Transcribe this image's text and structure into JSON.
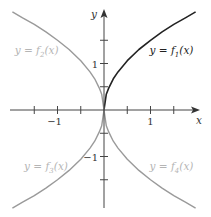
{
  "chart_data": {
    "type": "line",
    "title": "",
    "xlabel": "x",
    "ylabel": "y",
    "xlim": [
      -2,
      2
    ],
    "ylim": [
      -2,
      2
    ],
    "grid": false,
    "x_ticks": [
      -1.5,
      -1,
      -0.5,
      0.5,
      1,
      1.5
    ],
    "x_tick_labels": [
      {
        "value": -1,
        "label": "−1"
      },
      {
        "value": 1,
        "label": "1"
      }
    ],
    "y_ticks": [
      -1.5,
      -1,
      -0.5,
      0.5,
      1,
      1.5
    ],
    "y_tick_labels": [
      {
        "value": 1,
        "label": "1"
      },
      {
        "value": -1,
        "label": "−1"
      }
    ],
    "series": [
      {
        "name": "y = f1(x)",
        "label_main": "y = f",
        "label_sub": "1",
        "label_tail": "(x)",
        "color": "#222222",
        "quadrant": [
          1,
          1
        ],
        "x": [
          0,
          0.05,
          0.1,
          0.2,
          0.3,
          0.5,
          0.75,
          1,
          1.25,
          1.5,
          1.75,
          1.97
        ],
        "y": [
          0,
          0.34,
          0.47,
          0.67,
          0.82,
          1.06,
          1.3,
          1.5,
          1.68,
          1.84,
          1.98,
          2.11
        ]
      },
      {
        "name": "y = f2(x)",
        "label_main": "y = f",
        "label_sub": "2",
        "label_tail": "(x)",
        "color": "#9a9a9a",
        "quadrant": [
          -1,
          1
        ],
        "x": [
          0,
          -0.05,
          -0.1,
          -0.2,
          -0.3,
          -0.5,
          -0.75,
          -1,
          -1.25,
          -1.5,
          -1.75,
          -1.97
        ],
        "y": [
          0,
          0.34,
          0.47,
          0.67,
          0.82,
          1.06,
          1.3,
          1.5,
          1.68,
          1.84,
          1.98,
          2.11
        ]
      },
      {
        "name": "y = f3(x)",
        "label_main": "y = f",
        "label_sub": "3",
        "label_tail": "(x)",
        "color": "#9a9a9a",
        "quadrant": [
          -1,
          -1
        ],
        "x": [
          0,
          -0.05,
          -0.1,
          -0.2,
          -0.3,
          -0.5,
          -0.75,
          -1,
          -1.25,
          -1.5,
          -1.75,
          -1.97
        ],
        "y": [
          0,
          -0.34,
          -0.47,
          -0.67,
          -0.82,
          -1.06,
          -1.3,
          -1.5,
          -1.68,
          -1.84,
          -1.98,
          -2.11
        ]
      },
      {
        "name": "y = f4(x)",
        "label_main": "y = f",
        "label_sub": "4",
        "label_tail": "(x)",
        "color": "#9a9a9a",
        "quadrant": [
          1,
          -1
        ],
        "x": [
          0,
          0.05,
          0.1,
          0.2,
          0.3,
          0.5,
          0.75,
          1,
          1.25,
          1.5,
          1.75,
          1.97
        ],
        "y": [
          0,
          -0.34,
          -0.47,
          -0.67,
          -0.82,
          -1.06,
          -1.3,
          -1.5,
          -1.68,
          -1.84,
          -1.98,
          -2.11
        ]
      }
    ],
    "annotations": [
      {
        "series": 0,
        "text": "y = f1(x)",
        "x": 0.98,
        "y": 1.2,
        "color": "#222222"
      },
      {
        "series": 1,
        "text": "y = f2(x)",
        "x": -1.92,
        "y": 1.2,
        "color": "#b5b5b5"
      },
      {
        "series": 2,
        "text": "y = f3(x)",
        "x": -1.72,
        "y": -1.28,
        "color": "#b5b5b5"
      },
      {
        "series": 3,
        "text": "y = f4(x)",
        "x": 0.98,
        "y": -1.28,
        "color": "#b5b5b5"
      }
    ]
  },
  "axes": {
    "x_label": "x",
    "y_label": "y",
    "color": "#444444"
  }
}
